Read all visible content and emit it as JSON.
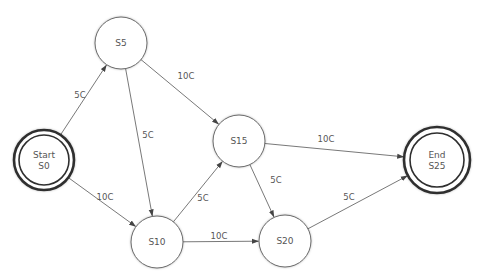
{
  "diagram": {
    "type": "finite-state-machine",
    "colors": {
      "background": "#ffffff",
      "node_stroke": "#6a6a6a",
      "terminal_stroke": "#2f2f2f",
      "edge": "#555555",
      "text": "#555555"
    },
    "nodes": [
      {
        "id": "S0",
        "lines": [
          "Start",
          "S0"
        ],
        "kind": "start",
        "x": 44,
        "y": 160,
        "r": 30,
        "r_inner": 25
      },
      {
        "id": "S5",
        "lines": [
          "S5"
        ],
        "kind": "state",
        "x": 121,
        "y": 43,
        "r": 26
      },
      {
        "id": "S10",
        "lines": [
          "S10"
        ],
        "kind": "state",
        "x": 157,
        "y": 242,
        "r": 26
      },
      {
        "id": "S15",
        "lines": [
          "S15"
        ],
        "kind": "state",
        "x": 239,
        "y": 141,
        "r": 26
      },
      {
        "id": "S20",
        "lines": [
          "S20"
        ],
        "kind": "state",
        "x": 285,
        "y": 241,
        "r": 26
      },
      {
        "id": "S25",
        "lines": [
          "End",
          "S25"
        ],
        "kind": "end",
        "x": 437,
        "y": 160,
        "r": 33,
        "r_inner": 27
      }
    ],
    "edges": [
      {
        "from": "S0",
        "to": "S5",
        "label": "5C",
        "lx": 80,
        "ly": 98
      },
      {
        "from": "S0",
        "to": "S10",
        "label": "10C",
        "lx": 105,
        "ly": 200
      },
      {
        "from": "S5",
        "to": "S10",
        "label": "5C",
        "lx": 148,
        "ly": 138
      },
      {
        "from": "S5",
        "to": "S15",
        "label": "10C",
        "lx": 186,
        "ly": 79
      },
      {
        "from": "S10",
        "to": "S15",
        "label": "5C",
        "lx": 203,
        "ly": 201
      },
      {
        "from": "S10",
        "to": "S20",
        "label": "10C",
        "lx": 219,
        "ly": 239
      },
      {
        "from": "S15",
        "to": "S25",
        "label": "10C",
        "lx": 326,
        "ly": 142
      },
      {
        "from": "S15",
        "to": "S20",
        "label": "5C",
        "lx": 276,
        "ly": 183
      },
      {
        "from": "S20",
        "to": "S25",
        "label": "5C",
        "lx": 349,
        "ly": 200
      }
    ]
  }
}
